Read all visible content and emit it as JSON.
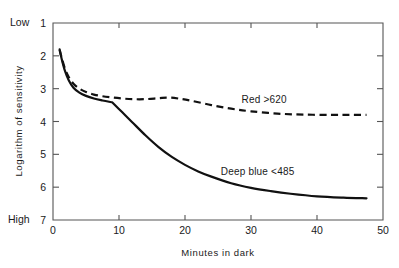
{
  "chart_data": {
    "type": "line",
    "title": "",
    "xlabel": "Minutes in dark",
    "ylabel": "Logarithm of sensitivity",
    "xlim": [
      0,
      50
    ],
    "ylim": [
      7,
      1
    ],
    "y_inverted": true,
    "grid": false,
    "legend_position": "inline-annotation",
    "xticks": [
      "0",
      "10",
      "20",
      "30",
      "40",
      "50"
    ],
    "xtick_values": [
      0,
      10,
      20,
      30,
      40,
      50
    ],
    "yticks": [
      "1",
      "2",
      "3",
      "4",
      "5",
      "6",
      "7"
    ],
    "ytick_values": [
      1,
      2,
      3,
      4,
      5,
      6,
      7
    ],
    "y_axis_end_labels": {
      "top": "Low",
      "bottom": "High"
    },
    "series": [
      {
        "name": "Red >620",
        "label": "Red >620",
        "style": "dashed",
        "color": "#111111",
        "annotation_x": 32,
        "annotation_y": 3.45,
        "x": [
          1.0,
          1.3,
          1.8,
          2.4,
          3.1,
          4.0,
          5.0,
          6.2,
          7.5,
          9.0,
          10.5,
          12.0,
          14.0,
          16.0,
          17.5,
          19.0,
          21.0,
          24.0,
          27.0,
          30.0,
          34.0,
          38.0,
          42.0,
          45.0,
          47.5
        ],
        "y": [
          1.82,
          2.05,
          2.38,
          2.65,
          2.85,
          3.0,
          3.1,
          3.18,
          3.23,
          3.27,
          3.3,
          3.32,
          3.32,
          3.29,
          3.27,
          3.3,
          3.37,
          3.5,
          3.61,
          3.69,
          3.76,
          3.79,
          3.8,
          3.8,
          3.8
        ]
      },
      {
        "name": "Deep blue <485",
        "label": "Deep blue <485",
        "style": "solid",
        "color": "#111111",
        "annotation_x": 31,
        "annotation_y": 5.62,
        "x": [
          1.0,
          1.3,
          1.8,
          2.4,
          3.1,
          4.0,
          5.0,
          6.2,
          7.5,
          9.0,
          10.5,
          12.0,
          14.0,
          16.0,
          18.0,
          20.0,
          22.0,
          24.0,
          27.0,
          30.0,
          33.0,
          36.0,
          40.0,
          44.0,
          47.5
        ],
        "y": [
          1.8,
          2.08,
          2.45,
          2.75,
          2.97,
          3.12,
          3.22,
          3.3,
          3.36,
          3.42,
          3.72,
          4.02,
          4.42,
          4.78,
          5.08,
          5.32,
          5.52,
          5.68,
          5.88,
          6.02,
          6.12,
          6.2,
          6.28,
          6.32,
          6.34
        ]
      }
    ]
  },
  "figure": {
    "caption": ""
  }
}
